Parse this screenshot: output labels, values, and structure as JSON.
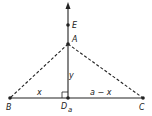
{
  "diagram": {
    "points": {
      "E": {
        "label": "E",
        "x": 68,
        "y": 25
      },
      "A": {
        "label": "A",
        "x": 68,
        "y": 44
      },
      "B": {
        "label": "B",
        "x": 10,
        "y": 98
      },
      "D": {
        "label": "D",
        "subscript": "a",
        "x": 68,
        "y": 98
      },
      "C": {
        "label": "C",
        "x": 143,
        "y": 98
      }
    },
    "segment_labels": {
      "BD": "x",
      "DC": "a − x",
      "AD": "y"
    },
    "lines": [
      {
        "from": "B",
        "to": "C",
        "style": "solid"
      },
      {
        "from": "D",
        "to": "top-arrow",
        "style": "solid",
        "arrow": true
      },
      {
        "from": "A",
        "to": "B",
        "style": "dashed"
      },
      {
        "from": "A",
        "to": "C",
        "style": "dashed"
      }
    ],
    "right_angle_marker": "D",
    "stroke_color": "#222222"
  }
}
